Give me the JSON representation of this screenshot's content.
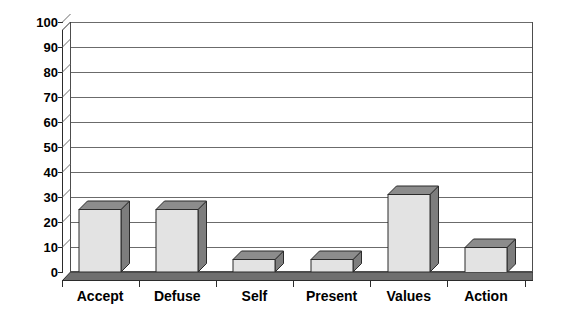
{
  "chart_data": {
    "type": "bar",
    "title": "",
    "subtitle": "",
    "xlabel": "",
    "ylabel": "",
    "categories": [
      "Accept",
      "Defuse",
      "Self",
      "Present",
      "Values",
      "Action"
    ],
    "values": [
      25,
      25,
      5,
      5,
      31,
      10
    ],
    "ylim": [
      0,
      100
    ],
    "ytick_step": 10,
    "yticks": [
      0,
      10,
      20,
      30,
      40,
      50,
      60,
      70,
      80,
      90,
      100
    ],
    "ytick_labels": [
      "0",
      "10",
      "20",
      "30",
      "40",
      "50",
      "60",
      "70",
      "80",
      "90",
      "100"
    ],
    "grid": true,
    "grid_axis": "y",
    "legend": false,
    "legend_position": "none",
    "style": "3d-column",
    "series": [
      {
        "name": "Series 1",
        "values": [
          25,
          25,
          5,
          5,
          31,
          10
        ]
      }
    ],
    "annotations": []
  },
  "colors": {
    "bar_front": "#e3e3e3",
    "bar_top": "#8c8c8c",
    "bar_side": "#7d7d7d",
    "bar_outline": "#2b2b2b",
    "plot_background": "#ffffff",
    "gridline": "#6b6b6b",
    "axis": "#2b2b2b",
    "floor_top": "#9a9a9a",
    "floor_front": "#6f6f6f",
    "text": "#000000",
    "page_background": "#ffffff"
  }
}
